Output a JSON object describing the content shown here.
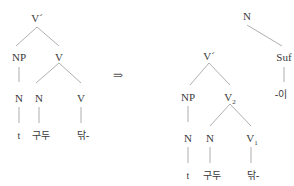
{
  "left_tree": {
    "root": "V´",
    "np": "NP",
    "v": "V",
    "np_n": "N",
    "v_n": "N",
    "v_v": "V",
    "leaf_trace": "t",
    "leaf_noun": "구두",
    "leaf_verb": "닦-"
  },
  "arrow": "⇒",
  "right_tree": {
    "root": "N",
    "vbar": "V´",
    "suf": "Suf",
    "suf_leaf": "-이",
    "np": "NP",
    "v2": "V",
    "v2_sub": "2",
    "np_n": "N",
    "v2_n": "N",
    "v1": "V",
    "v1_sub": "1",
    "leaf_trace": "t",
    "leaf_noun": "구두",
    "leaf_verb": "닦-"
  }
}
